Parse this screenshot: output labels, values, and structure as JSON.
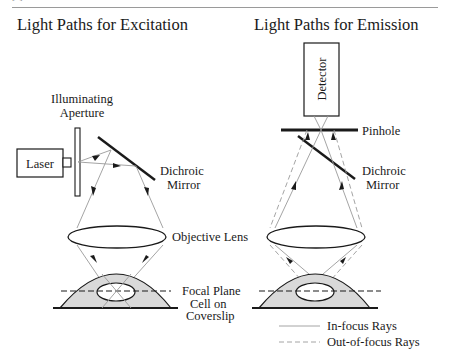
{
  "page_header": {
    "left": "[2]",
    "center": "Confocal Microscopy",
    "right": "11"
  },
  "excitation": {
    "title": "Light Paths for Excitation",
    "aperture_label_line1": "Illuminating",
    "aperture_label_line2": "Aperture",
    "laser_label": "Laser",
    "mirror_label_line1": "Dichroic",
    "mirror_label_line2": "Mirror",
    "objective_label": "Objective Lens",
    "focal_plane_label": "Focal Plane",
    "cell_label_line1": "Cell on",
    "cell_label_line2": "Coverslip"
  },
  "emission": {
    "title": "Light Paths for Emission",
    "detector_label": "Detector",
    "pinhole_label": "Pinhole",
    "mirror_label_line1": "Dichroic",
    "mirror_label_line2": "Mirror"
  },
  "legend": {
    "in_focus": "In-focus Rays",
    "out_of_focus": "Out-of-focus Rays"
  },
  "colors": {
    "ink": "#1a1a1a",
    "ray": "#9a9a9a",
    "cell_fill": "#d9d9d9"
  }
}
